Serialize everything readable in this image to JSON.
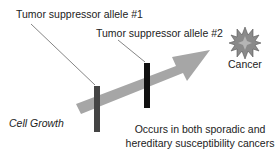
{
  "diagram": {
    "labels": {
      "allele1": "Tumor suppressor allele #1",
      "allele2": "Tumor suppressor allele #2",
      "cancer": "Cancer",
      "cell_growth": "Cell Growth",
      "note_line1": "Occurs in both sporadic and",
      "note_line2": "hereditary susceptibility cancers"
    },
    "colors": {
      "arrow": "#a6a6a6",
      "bar1": "#444444",
      "bar2": "#111111",
      "star": "#8a8a8a",
      "leader": "#666666"
    }
  }
}
